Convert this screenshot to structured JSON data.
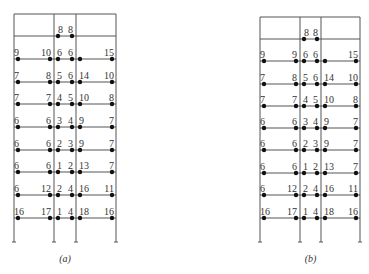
{
  "frames": [
    {
      "id": "a",
      "caption": "(a)",
      "x": [
        14,
        54,
        76,
        116
      ],
      "top": 14,
      "bottom": 242,
      "beam_y": [
        36,
        59,
        82,
        104,
        127,
        150,
        172,
        195,
        218
      ],
      "top_floor_labels": [
        "8",
        "8"
      ],
      "floors": [
        [
          "9",
          "10",
          "6",
          "6",
          "15"
        ],
        [
          "7",
          "8",
          "5",
          "6",
          "14",
          "10"
        ],
        [
          "7",
          "7",
          "4",
          "5",
          "10",
          "8"
        ],
        [
          "6",
          "6",
          "3",
          "4",
          "9",
          "7"
        ],
        [
          "6",
          "6",
          "2",
          "3",
          "9",
          "7"
        ],
        [
          "6",
          "6",
          "1",
          "2",
          "13",
          "7"
        ],
        [
          "6",
          "12",
          "2",
          "4",
          "16",
          "11"
        ],
        [
          "16",
          "17",
          "1",
          "4",
          "18",
          "16"
        ]
      ]
    },
    {
      "id": "b",
      "caption": "(b)",
      "x": [
        260,
        300,
        321,
        360
      ],
      "top": 17,
      "bottom": 242,
      "beam_y": [
        39,
        61,
        84,
        106,
        128,
        150,
        173,
        195,
        218
      ],
      "top_floor_labels": [
        "8",
        "8"
      ],
      "floors": [
        [
          "9",
          "9",
          "6",
          "6",
          "15"
        ],
        [
          "7",
          "8",
          "5",
          "6",
          "14",
          "10"
        ],
        [
          "7",
          "7",
          "4",
          "5",
          "10",
          "8"
        ],
        [
          "6",
          "6",
          "3",
          "4",
          "9",
          "7"
        ],
        [
          "6",
          "6",
          "2",
          "3",
          "9",
          "7"
        ],
        [
          "6",
          "6",
          "1",
          "2",
          "13",
          "7"
        ],
        [
          "6",
          "12",
          "2",
          "4",
          "16",
          "11"
        ],
        [
          "16",
          "17",
          "1",
          "4",
          "18",
          "16"
        ]
      ]
    }
  ],
  "colors": {
    "line": "#555555",
    "dot": "#111111",
    "text": "#333333"
  }
}
